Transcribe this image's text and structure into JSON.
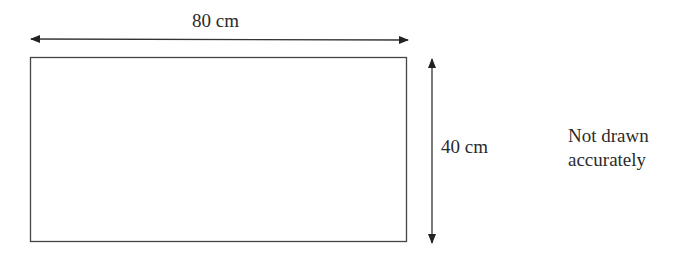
{
  "diagram": {
    "shape": "rectangle",
    "width_label": "80 cm",
    "height_label": "40 cm",
    "note": {
      "line1": "Not drawn",
      "line2": "accurately"
    },
    "colors": {
      "stroke": "#333333",
      "text": "#2b2b2b",
      "background": "#ffffff"
    }
  }
}
